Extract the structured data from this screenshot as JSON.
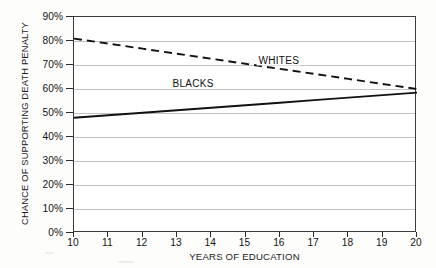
{
  "chart_data": {
    "type": "line",
    "title": "",
    "xlabel": "YEARS OF EDUCATION",
    "ylabel": "CHANCE OF SUPPORTING DEATH PENALTY",
    "x": [
      10,
      11,
      12,
      13,
      14,
      15,
      16,
      17,
      18,
      19,
      20
    ],
    "xtick_labels": [
      "10",
      "11",
      "12",
      "13",
      "14",
      "15",
      "16",
      "17",
      "18",
      "19",
      "20"
    ],
    "xlim": [
      10,
      20
    ],
    "ylim": [
      0,
      90
    ],
    "ytick_values": [
      0,
      10,
      20,
      30,
      40,
      50,
      60,
      70,
      80,
      90
    ],
    "ytick_labels": [
      "0%",
      "10%",
      "20%",
      "30%",
      "40%",
      "50%",
      "60%",
      "70%",
      "80%",
      "90%"
    ],
    "grid": "horizontal",
    "legend": "inline-annotations",
    "series": [
      {
        "name": "WHITES",
        "style": "dashed",
        "color": "#111111",
        "label_x": 16.0,
        "label_y": 71.5,
        "values": [
          81.0,
          78.9,
          76.8,
          74.7,
          72.6,
          70.5,
          68.4,
          66.3,
          64.2,
          62.1,
          60.0
        ]
      },
      {
        "name": "BLACKS",
        "style": "solid",
        "color": "#111111",
        "label_x": 13.5,
        "label_y": 62.0,
        "values": [
          48.0,
          49.05,
          50.1,
          51.15,
          52.2,
          53.25,
          54.3,
          55.35,
          56.4,
          57.45,
          58.5
        ]
      }
    ]
  }
}
